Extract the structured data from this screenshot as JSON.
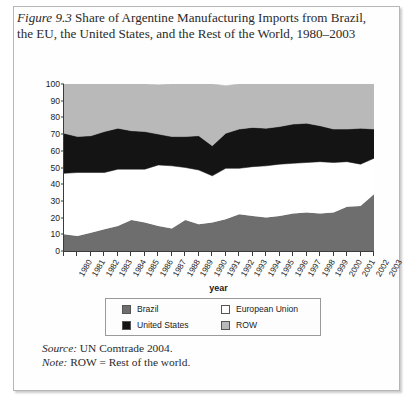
{
  "caption": {
    "figure_label": "Figure 9.3",
    "text": " Share of Argentine Manufacturing Imports from Brazil, the EU, the United States, and the Rest of the World, 1980–2003"
  },
  "notes": {
    "source_label": "Source:",
    "source_text": " UN Comtrade 2004.",
    "note_label": "Note:",
    "note_text": " ROW = Rest of the world."
  },
  "legend": {
    "items": [
      {
        "label": "Brazil",
        "color": "#6e6e6e",
        "swatch": "legend-swatch-brazil"
      },
      {
        "label": "European Union",
        "color": "#ffffff",
        "swatch": "legend-swatch-european-union"
      },
      {
        "label": "United States",
        "color": "#141414",
        "swatch": "legend-swatch-united-states"
      },
      {
        "label": "ROW",
        "color": "#b9b9b9",
        "swatch": "legend-swatch-row"
      }
    ]
  },
  "chart_data": {
    "type": "area",
    "stacked": true,
    "title": "Share of Argentine Manufacturing Imports from Brazil, the EU, the United States, and the Rest of the World, 1980–2003",
    "xlabel": "year",
    "ylabel": "percent",
    "ylim": [
      0,
      100
    ],
    "yticks": [
      0,
      10,
      20,
      30,
      40,
      50,
      60,
      70,
      80,
      90,
      100
    ],
    "grid": false,
    "legend_position": "bottom",
    "x": [
      1980,
      1981,
      1982,
      1983,
      1984,
      1985,
      1986,
      1987,
      1988,
      1989,
      1990,
      1991,
      1992,
      1993,
      1994,
      1995,
      1996,
      1997,
      1998,
      1999,
      2000,
      2001,
      2002,
      2003
    ],
    "categories": [
      "1980",
      "1981",
      "1982",
      "1983",
      "1984",
      "1985",
      "1986",
      "1987",
      "1988",
      "1989",
      "1990",
      "1991",
      "1992",
      "1993",
      "1994",
      "1995",
      "1996",
      "1997",
      "1998",
      "1999",
      "2000",
      "2001",
      "2002",
      "2003"
    ],
    "series": [
      {
        "name": "Brazil",
        "color": "#6e6e6e",
        "values": [
          10,
          9,
          11,
          13,
          15,
          18.5,
          17,
          15,
          13.5,
          18.5,
          16,
          17,
          19,
          22,
          21,
          20,
          21,
          22.5,
          23,
          22.5,
          23,
          26.5,
          27,
          34
        ]
      },
      {
        "name": "European Union",
        "color": "#ffffff",
        "values": [
          36.5,
          38,
          36,
          34,
          34,
          30.5,
          32,
          36.5,
          37.5,
          31.5,
          32.5,
          28,
          30.5,
          27.5,
          29.5,
          31,
          31,
          30,
          30,
          31,
          30,
          27,
          25,
          21.5
        ]
      },
      {
        "name": "United States",
        "color": "#141414",
        "values": [
          24,
          21.5,
          22,
          24.5,
          24.5,
          23,
          22.5,
          18.5,
          17.5,
          18.5,
          20.5,
          18,
          21,
          23.5,
          23.5,
          22.5,
          22.5,
          23.5,
          23.5,
          21.5,
          20,
          19.5,
          21.5,
          17.5
        ]
      },
      {
        "name": "ROW",
        "color": "#b9b9b9",
        "values": [
          29.5,
          31.5,
          31,
          28.5,
          26.5,
          28,
          28.5,
          29.5,
          31.5,
          31.5,
          31,
          37,
          28.5,
          27,
          26,
          26.5,
          25.5,
          24,
          23.5,
          25,
          27,
          27,
          26.5,
          27
        ]
      }
    ],
    "cumulative_boundaries": {
      "brazil_top": [
        10,
        9,
        11,
        13,
        15,
        18.5,
        17,
        15,
        13.5,
        18.5,
        16,
        17,
        19,
        22,
        21,
        20,
        21,
        22.5,
        23,
        22.5,
        23,
        26.5,
        27,
        34
      ],
      "eu_top": [
        46.5,
        47,
        47,
        47,
        49,
        49,
        49,
        51.5,
        51,
        50,
        48.5,
        45,
        49.5,
        49.5,
        50.5,
        51,
        52,
        52.5,
        53,
        53.5,
        53,
        53.5,
        52,
        55.5
      ],
      "united_states_top": [
        70.5,
        68.5,
        69,
        71.5,
        73.5,
        72,
        71.5,
        70,
        68.5,
        68.5,
        69,
        63,
        70.5,
        73,
        74,
        73.5,
        74.5,
        76,
        76.5,
        75,
        73,
        73,
        73.5,
        73
      ],
      "row_top": [
        100,
        100,
        100,
        100,
        100,
        100,
        100,
        100,
        100,
        100,
        100,
        100,
        100,
        100,
        100,
        100,
        100,
        100,
        100,
        100,
        100,
        100,
        100,
        100
      ]
    }
  }
}
